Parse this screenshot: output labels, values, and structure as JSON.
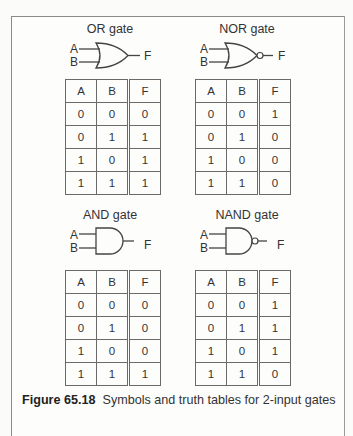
{
  "gates": [
    {
      "title": "OR gate",
      "symbol": "or-gate",
      "inputs": [
        "A",
        "B"
      ],
      "output": "F",
      "headers": [
        "A",
        "B",
        "F"
      ],
      "rows": [
        [
          "0",
          "0",
          "0"
        ],
        [
          "0",
          "1",
          "1"
        ],
        [
          "1",
          "0",
          "1"
        ],
        [
          "1",
          "1",
          "1"
        ]
      ]
    },
    {
      "title": "NOR gate",
      "symbol": "nor-gate",
      "inputs": [
        "A",
        "B"
      ],
      "output": "F",
      "headers": [
        "A",
        "B",
        "F"
      ],
      "rows": [
        [
          "0",
          "0",
          "1"
        ],
        [
          "0",
          "1",
          "0"
        ],
        [
          "1",
          "0",
          "0"
        ],
        [
          "1",
          "1",
          "0"
        ]
      ]
    },
    {
      "title": "AND gate",
      "symbol": "and-gate",
      "inputs": [
        "A",
        "B"
      ],
      "output": "F",
      "headers": [
        "A",
        "B",
        "F"
      ],
      "rows": [
        [
          "0",
          "0",
          "0"
        ],
        [
          "0",
          "1",
          "0"
        ],
        [
          "1",
          "0",
          "0"
        ],
        [
          "1",
          "1",
          "1"
        ]
      ]
    },
    {
      "title": "NAND gate",
      "symbol": "nand-gate",
      "inputs": [
        "A",
        "B"
      ],
      "output": "F",
      "headers": [
        "A",
        "B",
        "F"
      ],
      "rows": [
        [
          "0",
          "0",
          "1"
        ],
        [
          "0",
          "1",
          "1"
        ],
        [
          "1",
          "0",
          "1"
        ],
        [
          "1",
          "1",
          "0"
        ]
      ]
    }
  ],
  "caption": {
    "label": "Figure 65.18",
    "text": "Symbols and truth tables for 2-input gates"
  }
}
